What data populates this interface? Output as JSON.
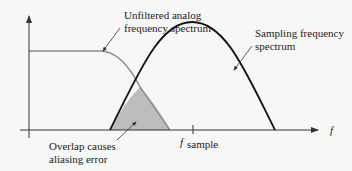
{
  "labels": {
    "unfiltered_line1": "Unfiltered analog",
    "unfiltered_line2": "frequency spectrum",
    "sampling_line1": "Sampling frequency",
    "sampling_line2": "spectrum",
    "overlap_line1": "Overlap causes",
    "overlap_line2": "aliasing error",
    "f_axis": "f",
    "f_sample_main": "f",
    "f_sample_sub": "sample"
  },
  "colors": {
    "axis": "#333333",
    "analog_curve": "#8a8a8a",
    "sampling_curve": "#111111",
    "overlap_fill": "#bdbdbd",
    "background": "#f7f7f5"
  }
}
